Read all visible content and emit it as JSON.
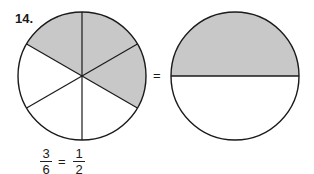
{
  "problem_number": "14.",
  "left_circle": {
    "parts": 6,
    "shaded": 3,
    "shade_color": "#c8c8c8"
  },
  "middle_equals": "=",
  "right_circle": {
    "parts": 2,
    "shaded": 1,
    "shade_color": "#c8c8c8"
  },
  "equation": {
    "left_fraction": {
      "numerator": "3",
      "denominator": "6"
    },
    "equals": "=",
    "right_fraction": {
      "numerator": "1",
      "denominator": "2"
    }
  }
}
